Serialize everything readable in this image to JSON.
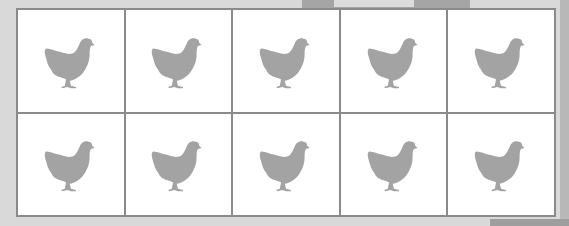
{
  "figure": {
    "rows": 2,
    "columns": 5,
    "icon": "chicken-icon",
    "icon_color": "#a3a3a3",
    "border_color": "#8a8a8a",
    "cells": [
      {
        "icon": "chicken-icon"
      },
      {
        "icon": "chicken-icon"
      },
      {
        "icon": "chicken-icon"
      },
      {
        "icon": "chicken-icon"
      },
      {
        "icon": "chicken-icon"
      },
      {
        "icon": "chicken-icon"
      },
      {
        "icon": "chicken-icon"
      },
      {
        "icon": "chicken-icon"
      },
      {
        "icon": "chicken-icon"
      },
      {
        "icon": "chicken-icon"
      }
    ],
    "total_count": 10
  }
}
